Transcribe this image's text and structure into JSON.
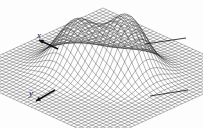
{
  "figure": {
    "title": "",
    "background_color": "#fdfdfd",
    "line_color": "#2b2b2b",
    "fill_color": "#ffffff"
  },
  "axes": {
    "x": {
      "label": "x",
      "arrow": "arrow-up-left",
      "label_x": 37,
      "label_y": 31
    },
    "y": {
      "label": "y",
      "arrow": "arrow-down-left",
      "label_x": 29,
      "label_y": 89
    }
  },
  "annotations": [
    {
      "name": "leader-line-upper-right",
      "x1": 145,
      "y1": 44,
      "x2": 186,
      "y2": 38,
      "text": ""
    },
    {
      "name": "leader-line-lower-right",
      "x1": 150,
      "y1": 96,
      "x2": 188,
      "y2": 90,
      "text": ""
    }
  ],
  "chart_data": {
    "type": "surface",
    "title": "",
    "xlabel": "x",
    "ylabel": "y",
    "zlabel": "",
    "grid": true,
    "legend": null,
    "projection": "3d-wireframe-mesh",
    "mesh": {
      "nx": 41,
      "ny": 41,
      "draw_rows": true,
      "draw_cols": true
    },
    "domain": {
      "x": [
        -3.0,
        3.0
      ],
      "y": [
        -3.0,
        3.0
      ]
    },
    "zlim": [
      0.0,
      1.0
    ],
    "view": {
      "elevation_deg": 28,
      "azimuth_deg": -52
    },
    "peaks": [
      {
        "name": "left-peak",
        "cx": -0.8,
        "cy": 0.3,
        "amplitude": 0.82,
        "sigma": 0.62,
        "screen_x": 85,
        "screen_y": 20
      },
      {
        "name": "right-peak",
        "cx": 0.55,
        "cy": -0.45,
        "amplitude": 1.0,
        "sigma": 0.6,
        "screen_x": 115,
        "screen_y": 12
      }
    ],
    "surface_function": "z = 0.82*exp(-((x+0.80)^2+(y-0.30)^2)/(2*0.62^2)) + 1.00*exp(-((x-0.55)^2+(y+0.45)^2)/(2*0.60^2))"
  }
}
